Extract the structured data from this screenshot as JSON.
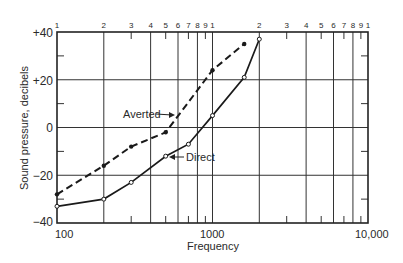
{
  "chart_data": {
    "type": "line",
    "title": "",
    "xlabel": "Frequency",
    "ylabel": "Sound pressure, decibels",
    "xscale": "log",
    "xlim": [
      100,
      10000
    ],
    "ylim": [
      -40,
      40
    ],
    "grid": true,
    "x_tick_labels": [
      "100",
      "1000",
      "10,000"
    ],
    "y_tick_labels": [
      "+40",
      "+20",
      "0",
      "−20",
      "−40"
    ],
    "top_cycle_labels": [
      "1",
      "2",
      "3",
      "4",
      "5",
      "6",
      "7",
      "8",
      "9",
      "1",
      "2",
      "3",
      "4",
      "5",
      "6",
      "7",
      "8",
      "9",
      "1"
    ],
    "series": [
      {
        "name": "Averted",
        "style": "dashed",
        "marker": "filled-dot",
        "x": [
          100,
          200,
          300,
          500,
          1000,
          1600
        ],
        "y": [
          -28,
          -16,
          -8,
          -2,
          24,
          35
        ]
      },
      {
        "name": "Direct",
        "style": "solid",
        "marker": "open-circle",
        "x": [
          100,
          200,
          300,
          500,
          700,
          1000,
          1600,
          2000
        ],
        "y": [
          -33,
          -30,
          -23,
          -12,
          -7,
          5,
          21,
          37
        ]
      }
    ],
    "annotations": [
      {
        "text": "Averted",
        "arrow_to": "Averted series near 600 Hz"
      },
      {
        "text": "Direct",
        "arrow_to": "Direct series near 600 Hz"
      }
    ]
  }
}
